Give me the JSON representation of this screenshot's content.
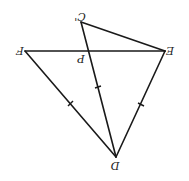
{
  "diagram": {
    "type": "geometry",
    "orientation": "rotated 180 degrees",
    "points": {
      "C_prime": {
        "label": "C'",
        "x": 81,
        "y": 22
      },
      "F": {
        "label": "F",
        "x": 25,
        "y": 51
      },
      "E": {
        "label": "E",
        "x": 165,
        "y": 51
      },
      "P": {
        "label": "P",
        "x": 86,
        "y": 51
      },
      "D": {
        "label": "D",
        "x": 116,
        "y": 157
      }
    },
    "segments": [
      {
        "from": "F",
        "to": "E"
      },
      {
        "from": "C_prime",
        "to": "E"
      },
      {
        "from": "C_prime",
        "to": "D"
      },
      {
        "from": "F",
        "to": "D"
      },
      {
        "from": "E",
        "to": "D"
      }
    ],
    "equal_marks": [
      "FD",
      "PD",
      "ED"
    ],
    "colors": {
      "stroke": "#1a1a1a",
      "background": "#ffffff"
    }
  }
}
